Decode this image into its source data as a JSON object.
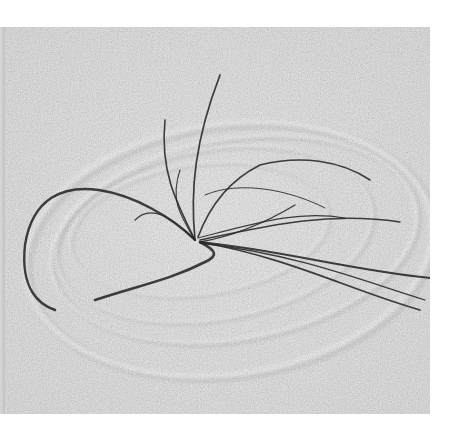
{
  "image": {
    "subject": "grass blades anchored in sand, wind-swept tips tracing concentric circular grooves",
    "palette": {
      "background": "#ffffff",
      "sand": "#c6c6c6",
      "sand_light": "#dedede",
      "groove_shadow": "#8f8f8f",
      "groove_highlight": "#ececec",
      "blade": "#2a2a2a"
    },
    "frame": {
      "x": 5,
      "y": 27,
      "width": 425,
      "height": 387
    },
    "grooves": [
      {
        "cx": 230,
        "cy": 250,
        "rx": 205,
        "ry": 125,
        "rot": -8,
        "w": 10,
        "shade": "#b0b0b0"
      },
      {
        "cx": 235,
        "cy": 240,
        "rx": 185,
        "ry": 100,
        "rot": -10,
        "w": 6,
        "shade": "#a5a5a5"
      },
      {
        "cx": 215,
        "cy": 235,
        "rx": 160,
        "ry": 85,
        "rot": -10,
        "w": 4,
        "shade": "#b5b5b5"
      },
      {
        "cx": 200,
        "cy": 230,
        "rx": 130,
        "ry": 65,
        "rot": -8,
        "w": 3,
        "shade": "#b8b8b8"
      }
    ],
    "blades": [
      {
        "d": "M195,240 C150,195 40,150 25,245 C20,290 40,305 55,310",
        "w": 2.4
      },
      {
        "d": "M200,242 C215,250 220,255 205,262 C170,280 140,285 95,300",
        "w": 2.6
      },
      {
        "d": "M195,240 C175,200 160,170 165,120",
        "w": 1.6
      },
      {
        "d": "M195,240 C190,190 195,140 220,75",
        "w": 1.7
      },
      {
        "d": "M195,240 C180,215 170,200 180,170",
        "w": 1.1
      },
      {
        "d": "M195,240 C170,215 150,205 135,220",
        "w": 1.2
      },
      {
        "d": "M200,242 C240,235 270,220 295,205",
        "w": 1.4
      },
      {
        "d": "M200,240 C250,230 320,210 400,222",
        "w": 1.5
      },
      {
        "d": "M198,238 C260,222 300,210 345,218",
        "w": 1.2
      },
      {
        "d": "M200,242 C280,250 350,270 430,278",
        "w": 1.8
      },
      {
        "d": "M200,242 C290,258 350,290 420,310",
        "w": 1.7
      },
      {
        "d": "M200,243 C300,255 360,280 425,300",
        "w": 1.3
      },
      {
        "d": "M198,237 C210,205 230,180 260,165 C300,155 340,160 370,180",
        "w": 1.6
      },
      {
        "d": "M205,195 C240,180 290,190 325,208",
        "w": 1.0
      }
    ]
  }
}
